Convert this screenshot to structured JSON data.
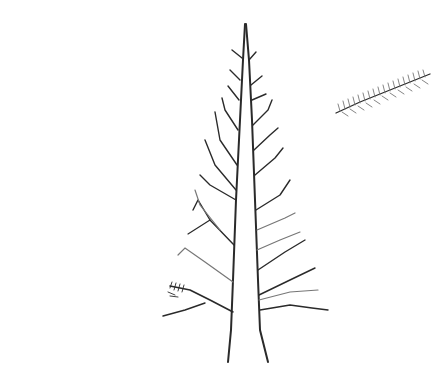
{
  "image": {
    "subject": "pencil sketch of a bare conifer tree with a separate sprig",
    "background": "#ffffff",
    "stroke_color": "#2a2a2a"
  }
}
